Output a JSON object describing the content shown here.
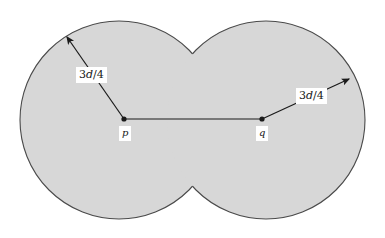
{
  "figure": {
    "type": "geometry-diagram",
    "background_color": "#ffffff",
    "shape_fill_color": "#d7d7d7",
    "shape_stroke_color": "#4a4a4a",
    "line_color": "#1a1a1a",
    "label_text_color": "#161616",
    "label_bg_color": "#ffffff",
    "circles": [
      {
        "name": "left-disk",
        "cx": 119,
        "cy": 120,
        "r": 99
      },
      {
        "name": "right-disk",
        "cx": 266,
        "cy": 120,
        "r": 99
      }
    ],
    "points": [
      {
        "name": "p",
        "label": "p",
        "x": 124,
        "y": 119,
        "label_x": 119,
        "label_y": 126
      },
      {
        "name": "q",
        "label": "q",
        "x": 262,
        "y": 119,
        "label_x": 256,
        "label_y": 126
      }
    ],
    "segment_pq": {
      "x1": 124,
      "y1": 119,
      "x2": 262,
      "y2": 119
    },
    "radius_arrows": [
      {
        "name": "left-radius-arrow",
        "label": "3d/4",
        "label_prefix": "3",
        "label_var": "d",
        "label_suffix": "/4",
        "from_x": 124,
        "from_y": 119,
        "to_x": 64,
        "to_y": 33,
        "label_x": 76,
        "label_y": 67
      },
      {
        "name": "right-radius-arrow",
        "label": "3d/4",
        "label_prefix": "3",
        "label_var": "d",
        "label_suffix": "/4",
        "from_x": 262,
        "from_y": 119,
        "to_x": 353,
        "to_y": 77,
        "label_x": 296,
        "label_y": 88
      }
    ]
  }
}
